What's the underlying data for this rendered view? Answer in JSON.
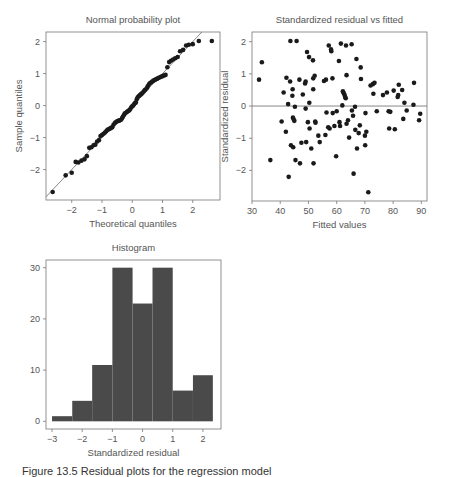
{
  "figure": {
    "caption": "Figure 13.5 Residual plots for the regression model"
  },
  "chart_data": [
    {
      "id": "qq",
      "type": "scatter",
      "title": "Normal probability plot",
      "xlabel": "Theoretical quantiles",
      "ylabel": "Sample quantiles",
      "xlim": [
        -2.85,
        2.9
      ],
      "ylim": [
        -2.95,
        2.3
      ],
      "xticks": [
        -2,
        -1,
        0,
        1,
        2
      ],
      "yticks": [
        -2,
        -1,
        0,
        1,
        2
      ],
      "grid": false,
      "reference_line": {
        "slope": 1.0,
        "intercept": 0.0
      },
      "points": [
        [
          -2.63,
          -2.7
        ],
        [
          -2.2,
          -2.18
        ],
        [
          -2.0,
          -2.1
        ],
        [
          -1.87,
          -1.76
        ],
        [
          -1.78,
          -1.78
        ],
        [
          -1.68,
          -1.72
        ],
        [
          -1.58,
          -1.68
        ],
        [
          -1.5,
          -1.58
        ],
        [
          -1.42,
          -1.32
        ],
        [
          -1.35,
          -1.3
        ],
        [
          -1.28,
          -1.24
        ],
        [
          -1.22,
          -1.22
        ],
        [
          -1.16,
          -1.12
        ],
        [
          -1.1,
          -1.08
        ],
        [
          -1.05,
          -0.95
        ],
        [
          -1.0,
          -0.92
        ],
        [
          -0.95,
          -0.88
        ],
        [
          -0.9,
          -0.84
        ],
        [
          -0.86,
          -0.8
        ],
        [
          -0.82,
          -0.76
        ],
        [
          -0.78,
          -0.74
        ],
        [
          -0.74,
          -0.72
        ],
        [
          -0.7,
          -0.69
        ],
        [
          -0.66,
          -0.68
        ],
        [
          -0.62,
          -0.6
        ],
        [
          -0.58,
          -0.55
        ],
        [
          -0.55,
          -0.52
        ],
        [
          -0.51,
          -0.5
        ],
        [
          -0.48,
          -0.48
        ],
        [
          -0.44,
          -0.47
        ],
        [
          -0.41,
          -0.46
        ],
        [
          -0.38,
          -0.45
        ],
        [
          -0.34,
          -0.4
        ],
        [
          -0.31,
          -0.35
        ],
        [
          -0.28,
          -0.3
        ],
        [
          -0.25,
          -0.25
        ],
        [
          -0.22,
          -0.23
        ],
        [
          -0.18,
          -0.2
        ],
        [
          -0.15,
          -0.18
        ],
        [
          -0.12,
          -0.16
        ],
        [
          -0.09,
          -0.14
        ],
        [
          -0.06,
          -0.1
        ],
        [
          -0.03,
          -0.05
        ],
        [
          0.0,
          -0.02
        ],
        [
          0.03,
          0.0
        ],
        [
          0.06,
          0.04
        ],
        [
          0.09,
          0.08
        ],
        [
          0.12,
          0.1
        ],
        [
          0.15,
          0.2
        ],
        [
          0.18,
          0.26
        ],
        [
          0.22,
          0.3
        ],
        [
          0.25,
          0.32
        ],
        [
          0.28,
          0.35
        ],
        [
          0.31,
          0.37
        ],
        [
          0.34,
          0.4
        ],
        [
          0.38,
          0.44
        ],
        [
          0.41,
          0.48
        ],
        [
          0.44,
          0.5
        ],
        [
          0.48,
          0.54
        ],
        [
          0.51,
          0.6
        ],
        [
          0.55,
          0.66
        ],
        [
          0.58,
          0.7
        ],
        [
          0.62,
          0.72
        ],
        [
          0.66,
          0.75
        ],
        [
          0.7,
          0.78
        ],
        [
          0.74,
          0.8
        ],
        [
          0.78,
          0.82
        ],
        [
          0.82,
          0.84
        ],
        [
          0.86,
          0.86
        ],
        [
          0.9,
          0.88
        ],
        [
          0.95,
          0.9
        ],
        [
          1.0,
          0.92
        ],
        [
          1.05,
          0.94
        ],
        [
          1.1,
          0.96
        ],
        [
          1.16,
          1.2
        ],
        [
          1.22,
          1.36
        ],
        [
          1.28,
          1.4
        ],
        [
          1.35,
          1.44
        ],
        [
          1.42,
          1.48
        ],
        [
          1.5,
          1.52
        ],
        [
          1.58,
          1.7
        ],
        [
          1.68,
          1.74
        ],
        [
          1.78,
          1.88
        ],
        [
          1.87,
          1.9
        ],
        [
          2.0,
          1.92
        ],
        [
          2.2,
          2.02
        ],
        [
          2.63,
          2.02
        ]
      ]
    },
    {
      "id": "resid_vs_fitted",
      "type": "scatter",
      "title": "Standardized residual vs fitted",
      "xlabel": "Fitted values",
      "ylabel": "Standardized residual",
      "xlim": [
        30,
        92
      ],
      "ylim": [
        -2.95,
        2.3
      ],
      "xticks": [
        30,
        40,
        50,
        60,
        70,
        80,
        90
      ],
      "yticks": [
        -2,
        -1,
        0,
        1,
        2
      ],
      "grid": false,
      "reference_line": {
        "y": 0
      },
      "points": [
        [
          32.5,
          0.82
        ],
        [
          33.5,
          1.36
        ],
        [
          36.5,
          -1.68
        ],
        [
          40.5,
          -0.48
        ],
        [
          41.2,
          0.42
        ],
        [
          42,
          -0.8
        ],
        [
          42.2,
          0.88
        ],
        [
          42.8,
          0.06
        ],
        [
          43,
          -2.2
        ],
        [
          43.5,
          0.76
        ],
        [
          43.6,
          2.02
        ],
        [
          43.8,
          -1.22
        ],
        [
          44.3,
          0.32
        ],
        [
          44.4,
          0.52
        ],
        [
          44.5,
          -0.36
        ],
        [
          44.6,
          -1.28
        ],
        [
          44.8,
          -0.42
        ],
        [
          45,
          -0.46
        ],
        [
          45.2,
          -0.02
        ],
        [
          45.4,
          -1.68
        ],
        [
          45.8,
          2.02
        ],
        [
          46.8,
          0.82
        ],
        [
          47,
          -1.78
        ],
        [
          47.5,
          -1.14
        ],
        [
          48,
          0.36
        ],
        [
          48.8,
          0.7
        ],
        [
          49,
          0.76
        ],
        [
          49,
          -0.08
        ],
        [
          49.2,
          -1.12
        ],
        [
          49.5,
          1.68
        ],
        [
          49.8,
          -0.5
        ],
        [
          50.2,
          1.52
        ],
        [
          50.3,
          0.1
        ],
        [
          50.4,
          -0.7
        ],
        [
          51,
          -1.32
        ],
        [
          51.6,
          1.42
        ],
        [
          51.7,
          0.52
        ],
        [
          51.7,
          0.86
        ],
        [
          51.8,
          -1.78
        ],
        [
          52.2,
          0.94
        ],
        [
          52.4,
          -0.48
        ],
        [
          52.5,
          -0.52
        ],
        [
          53.5,
          -0.92
        ],
        [
          54,
          -1.12
        ],
        [
          55.5,
          0.78
        ],
        [
          56,
          -0.9
        ],
        [
          56.2,
          0.82
        ],
        [
          56.4,
          -0.2
        ],
        [
          57,
          -0.66
        ],
        [
          57.2,
          1.88
        ],
        [
          57.5,
          -0.7
        ],
        [
          58,
          1.76
        ],
        [
          58.1,
          1.7
        ],
        [
          58.5,
          0.86
        ],
        [
          58.6,
          -0.22
        ],
        [
          59.2,
          -0.62
        ],
        [
          59.8,
          -1.56
        ],
        [
          60,
          -0.16
        ],
        [
          60.8,
          1.4
        ],
        [
          61,
          -0.5
        ],
        [
          61.2,
          -0.62
        ],
        [
          61.5,
          1.94
        ],
        [
          62,
          0.02
        ],
        [
          62.2,
          0.46
        ],
        [
          62.5,
          0.4
        ],
        [
          62.8,
          0.34
        ],
        [
          63,
          0.28
        ],
        [
          63.2,
          0.24
        ],
        [
          63.3,
          1.88
        ],
        [
          63.5,
          0.96
        ],
        [
          63.5,
          -0.55
        ],
        [
          64,
          -0.44
        ],
        [
          64.4,
          -0.98
        ],
        [
          65.3,
          1.92
        ],
        [
          65.4,
          -0.14
        ],
        [
          65.8,
          -0.3
        ],
        [
          66,
          -2.1
        ],
        [
          66.5,
          -0.02
        ],
        [
          66.6,
          -0.74
        ],
        [
          67,
          1.46
        ],
        [
          67.2,
          -1.32
        ],
        [
          67.8,
          -0.84
        ],
        [
          68.2,
          -0.6
        ],
        [
          68.5,
          1.2
        ],
        [
          68.6,
          0.84
        ],
        [
          70,
          -0.92
        ],
        [
          70.1,
          -1.22
        ],
        [
          70.2,
          -0.22
        ],
        [
          70.5,
          -0.8
        ],
        [
          71.2,
          -2.68
        ],
        [
          72,
          0.64
        ],
        [
          72.8,
          0.68
        ],
        [
          73,
          0.38
        ],
        [
          73.4,
          0.72
        ],
        [
          74.2,
          -0.16
        ],
        [
          76.4,
          0.34
        ],
        [
          77.8,
          0.42
        ],
        [
          78.4,
          -0.16
        ],
        [
          78.6,
          -0.7
        ],
        [
          79,
          -0.18
        ],
        [
          80.2,
          0.48
        ],
        [
          80.6,
          -0.72
        ],
        [
          81.6,
          0.28
        ],
        [
          81.8,
          0.34
        ],
        [
          82,
          0.66
        ],
        [
          83.2,
          0.5
        ],
        [
          83.6,
          -0.4
        ],
        [
          84,
          0.1
        ],
        [
          84.8,
          -0.14
        ],
        [
          87.2,
          0.04
        ],
        [
          87.4,
          0.72
        ],
        [
          89.2,
          -0.44
        ],
        [
          89.6,
          -0.24
        ]
      ]
    },
    {
      "id": "histogram",
      "type": "bar",
      "title": "Histogram",
      "xlabel": "Standardized residual",
      "ylabel": "",
      "bin_edges": [
        -3.0,
        -2.33,
        -1.67,
        -1.0,
        -0.33,
        0.33,
        1.0,
        1.67,
        2.33
      ],
      "values": [
        1,
        4,
        11,
        30,
        23,
        30,
        6,
        9
      ],
      "xlim": [
        -3.2,
        2.6
      ],
      "ylim": [
        -1.5,
        31.5
      ],
      "xticks": [
        -3,
        -2,
        -1,
        0,
        1,
        2
      ],
      "yticks": [
        0,
        10,
        20,
        30
      ],
      "grid": false,
      "bar_color": "#4a4a4a"
    }
  ],
  "layout": {
    "panels": {
      "qq": {
        "frame": [
          46,
          32,
          220,
          200
        ],
        "title_y": 23
      },
      "resid_vs_fitted": {
        "frame": [
          252,
          32,
          427,
          201
        ],
        "title_y": 23
      },
      "histogram": {
        "frame": [
          46,
          260,
          221,
          429
        ],
        "title_y": 251
      }
    },
    "axis_color": "#777777",
    "point_color": "#1a1a1a",
    "line_color": "#888888"
  }
}
